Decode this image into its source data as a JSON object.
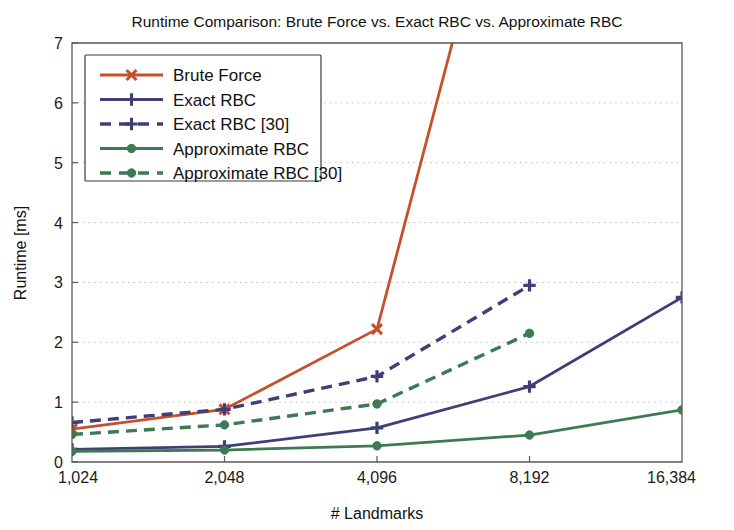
{
  "chart_data": {
    "type": "line",
    "title": "Runtime Comparison: Brute Force vs. Exact RBC vs. Approximate RBC",
    "xlabel": "# Landmarks",
    "ylabel": "Runtime [ms]",
    "categories": [
      "1,024",
      "2,048",
      "4,096",
      "8,192",
      "16,384"
    ],
    "x_tick_labels": [
      "1,024",
      "2,048",
      "4,096",
      "8,192",
      "16,384"
    ],
    "y_tick_labels": [
      "0",
      "1",
      "2",
      "3",
      "4",
      "5",
      "6",
      "7"
    ],
    "ylim": [
      0,
      7
    ],
    "y_ticks": [
      0,
      1,
      2,
      3,
      4,
      5,
      6,
      7
    ],
    "grid": "horizontal-dotted",
    "legend_position": "upper-left-inside",
    "clipped_note": "Brute Force series exceeds the axis maximum between 4,096 and 8,192 and is clipped at 7",
    "series": [
      {
        "name": "Brute Force",
        "color": "#c4512b",
        "dash": "solid",
        "marker": "x",
        "values": [
          0.55,
          0.88,
          2.22,
          11.9,
          null
        ]
      },
      {
        "name": "Exact RBC",
        "color": "#3f3f78",
        "dash": "solid",
        "marker": "plus",
        "values": [
          0.21,
          0.26,
          0.57,
          1.26,
          2.75
        ]
      },
      {
        "name": "Exact RBC [30]",
        "color": "#3f3f78",
        "dash": "dashed",
        "marker": "plus",
        "values": [
          0.66,
          0.88,
          1.43,
          2.95,
          null
        ]
      },
      {
        "name": "Approximate RBC",
        "color": "#3d7a52",
        "dash": "solid",
        "marker": "circle",
        "values": [
          0.18,
          0.2,
          0.27,
          0.45,
          0.87
        ]
      },
      {
        "name": "Approximate RBC [30]",
        "color": "#3d7a52",
        "dash": "dashed",
        "marker": "circle",
        "values": [
          0.46,
          0.62,
          0.97,
          2.15,
          null
        ]
      }
    ]
  },
  "legend": {
    "items": [
      {
        "label": "Brute Force"
      },
      {
        "label": "Exact RBC"
      },
      {
        "label": "Exact RBC [30]"
      },
      {
        "label": "Approximate RBC"
      },
      {
        "label": "Approximate RBC [30]"
      }
    ]
  }
}
